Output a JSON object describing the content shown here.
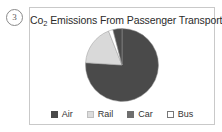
{
  "question_number": "3",
  "card": {
    "title_prefix": "Co",
    "title_sub": "2",
    "title_rest": " Emissions From Passenger Transport",
    "title_full": "Co2 Emissions From Passenger Transport"
  },
  "chart_data": {
    "type": "pie",
    "title": "Co2 Emissions From Passenger Transport",
    "xlabel": "",
    "ylabel": "",
    "legend_position": "bottom",
    "grid": false,
    "categories": [
      "Air",
      "Rail",
      "Car",
      "Bus"
    ],
    "values": [
      4,
      18,
      76,
      2
    ],
    "colors": [
      "#4a4a4a",
      "#d9d9d9",
      "#4a4a4a",
      "#ffffff"
    ],
    "slices": [
      {
        "label": "Car",
        "value": 76,
        "color": "#4a4a4a",
        "start_deg": 0,
        "end_deg": 273.6
      },
      {
        "label": "Rail",
        "value": 18,
        "color": "#d9d9d9",
        "start_deg": 273.6,
        "end_deg": 338.4
      },
      {
        "label": "Bus",
        "value": 2,
        "color": "#ffffff",
        "start_deg": 338.4,
        "end_deg": 345.6
      },
      {
        "label": "Air",
        "value": 4,
        "color": "#4a4a4a",
        "start_deg": 345.6,
        "end_deg": 360
      }
    ]
  },
  "legend": {
    "items": [
      {
        "label": "Air",
        "swatch": "#4a4a4a",
        "border": "#4a4a4a"
      },
      {
        "label": "Rail",
        "swatch": "#dcdcdc",
        "border": "#c0c0c0"
      },
      {
        "label": "Car",
        "swatch": "#6e6e6e",
        "border": "#6e6e6e"
      },
      {
        "label": "Bus",
        "swatch": "#ffffff",
        "border": "#777777"
      }
    ]
  },
  "palette": {
    "card_border": "#c9c9c9",
    "pie_dark": "#4a4a4a",
    "pie_light": "#d9d9d9",
    "pie_white": "#ffffff",
    "text": "#2b2b2b",
    "background": "#ffffff"
  }
}
